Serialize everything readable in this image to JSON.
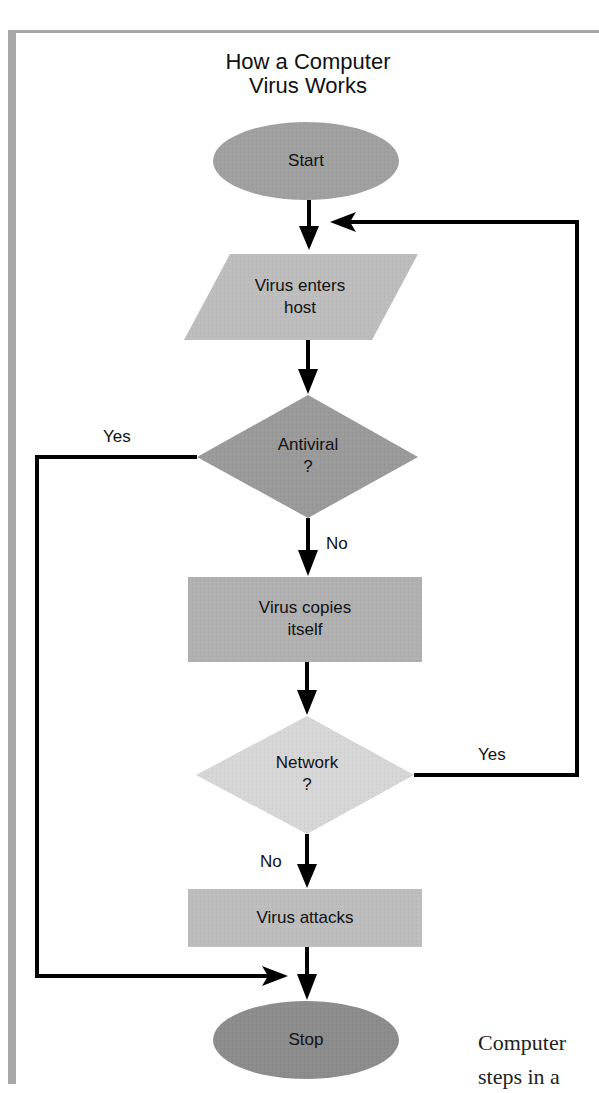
{
  "diagram": {
    "title_line1": "How a Computer",
    "title_line2": "Virus Works",
    "nodes": {
      "start": {
        "label": "Start",
        "shape": "ellipse",
        "color": "#a0a0a0"
      },
      "enters": {
        "line1": "Virus enters",
        "line2": "host",
        "shape": "parallelogram",
        "color": "#bdbdbd"
      },
      "antiviral": {
        "line1": "Antiviral",
        "line2": "?",
        "shape": "diamond",
        "color": "#9a9a9a"
      },
      "copies": {
        "line1": "Virus copies",
        "line2": "itself",
        "shape": "rectangle",
        "color": "#b0b0b0"
      },
      "network": {
        "line1": "Network",
        "line2": "?",
        "shape": "diamond",
        "color": "#d6d6d6"
      },
      "attacks": {
        "label": "Virus attacks",
        "shape": "rectangle",
        "color": "#bdbdbd"
      },
      "stop": {
        "label": "Stop",
        "shape": "ellipse",
        "color": "#8c8c8c"
      }
    },
    "edges": {
      "antiviral_yes": "Yes",
      "antiviral_no": "No",
      "network_yes": "Yes",
      "network_no": "No"
    }
  },
  "page_text": {
    "line1": "Computer",
    "line2": "steps in a"
  }
}
